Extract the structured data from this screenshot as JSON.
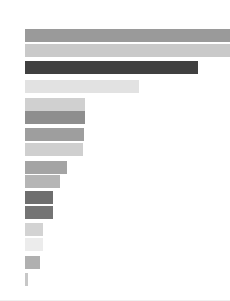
{
  "chart_data": {
    "type": "bar",
    "orientation": "horizontal",
    "title": "",
    "subtitle": "",
    "xlabel": "",
    "ylabel": "",
    "grid": false,
    "legend": null,
    "axis_visible": false,
    "tick_labels": [],
    "xlim": [
      0,
      210
    ],
    "categories": [
      "1",
      "2",
      "3",
      "4",
      "5",
      "6",
      "7",
      "8",
      "9",
      "10",
      "11",
      "12",
      "13",
      "14",
      "15",
      "16"
    ],
    "values": [
      205,
      205,
      173,
      114,
      60,
      60,
      59,
      58,
      42,
      35,
      28,
      28,
      18,
      18,
      15,
      3
    ],
    "bar_colors": [
      "#9a9a9a",
      "#c9c9c9",
      "#404040",
      "#e2e2e2",
      "#d0d0d0",
      "#8e8e8e",
      "#9e9e9e",
      "#cfcfcf",
      "#a4a4a4",
      "#b5b5b5",
      "#6e6e6e",
      "#747474",
      "#d3d3d3",
      "#ececec",
      "#b0b0b0",
      "#c7c7c7"
    ],
    "bar_tops": [
      29,
      44,
      61,
      80,
      98,
      111,
      128,
      143,
      161,
      175,
      191,
      206,
      223,
      238,
      256,
      273
    ],
    "bar_height": 13,
    "bar_left": 25,
    "background_color": "#ffffff",
    "bottom_rule_color": "#f0f0f0"
  }
}
